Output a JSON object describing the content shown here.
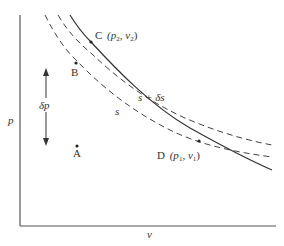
{
  "axes": {
    "y_label": "p",
    "x_label": "v"
  },
  "curves": {
    "solid": {
      "style": "solid"
    },
    "isentrope_s": {
      "label": "s",
      "style": "dashed"
    },
    "isentrope_s_plus": {
      "label": "s + δs",
      "style": "dashed"
    }
  },
  "points": {
    "A": {
      "label": "A"
    },
    "B": {
      "label": "B"
    },
    "C": {
      "label": "C",
      "coords": "(p",
      "p_sub": "2",
      "sep": ", v",
      "v_sub": "2",
      "close": ")"
    },
    "D": {
      "label": "D",
      "coords": "(p",
      "p_sub": "1",
      "sep": ", v",
      "v_sub": "1",
      "close": ")"
    }
  },
  "arrow": {
    "label": "δp"
  },
  "colors": {
    "ink": "#333333",
    "background": "#ffffff"
  }
}
